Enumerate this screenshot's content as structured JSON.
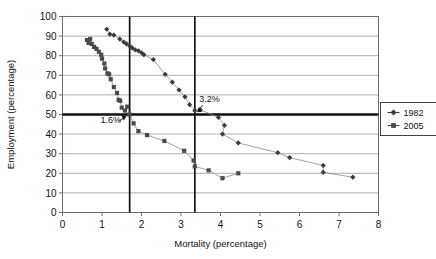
{
  "chart_data": {
    "type": "scatter",
    "title": "",
    "xlabel": "Mortality (percentage)",
    "ylabel": "Employment (percentage)",
    "xlim": [
      0,
      8
    ],
    "ylim": [
      0,
      100
    ],
    "xticks": [
      0,
      1,
      2,
      3,
      4,
      5,
      6,
      7,
      8
    ],
    "yticks": [
      0,
      10,
      20,
      30,
      40,
      50,
      60,
      70,
      80,
      90,
      100
    ],
    "grid": "horizontal",
    "legend_position": "right",
    "series": [
      {
        "name": "1982",
        "marker": "diamond",
        "color": "#3a3a3a",
        "points": [
          [
            1.12,
            93.5
          ],
          [
            1.2,
            91.0
          ],
          [
            1.3,
            90.5
          ],
          [
            1.45,
            88.5
          ],
          [
            1.55,
            87.0
          ],
          [
            1.62,
            86.0
          ],
          [
            1.7,
            85.0
          ],
          [
            1.76,
            84.0
          ],
          [
            1.84,
            83.0
          ],
          [
            1.92,
            82.5
          ],
          [
            2.0,
            81.5
          ],
          [
            2.06,
            80.5
          ],
          [
            2.3,
            78.0
          ],
          [
            2.6,
            70.5
          ],
          [
            2.78,
            66.5
          ],
          [
            2.95,
            62.5
          ],
          [
            3.1,
            59.0
          ],
          [
            3.22,
            55.0
          ],
          [
            3.35,
            52.0
          ],
          [
            3.48,
            52.5
          ],
          [
            3.95,
            48.5
          ],
          [
            4.1,
            44.5
          ],
          [
            4.05,
            40.0
          ],
          [
            4.45,
            35.5
          ],
          [
            5.45,
            30.5
          ],
          [
            5.75,
            28.0
          ],
          [
            6.6,
            24.0
          ],
          [
            6.6,
            20.5
          ],
          [
            7.35,
            18.0
          ]
        ]
      },
      {
        "name": "2005",
        "marker": "square",
        "color": "#4a4a4a",
        "points": [
          [
            0.62,
            88.0
          ],
          [
            0.66,
            86.5
          ],
          [
            0.7,
            88.5
          ],
          [
            0.74,
            86.0
          ],
          [
            0.8,
            84.5
          ],
          [
            0.86,
            83.5
          ],
          [
            0.92,
            82.0
          ],
          [
            0.98,
            80.5
          ],
          [
            1.0,
            78.5
          ],
          [
            1.06,
            76.0
          ],
          [
            1.08,
            73.5
          ],
          [
            1.14,
            71.0
          ],
          [
            1.18,
            70.5
          ],
          [
            1.22,
            68.0
          ],
          [
            1.3,
            64.0
          ],
          [
            1.38,
            61.0
          ],
          [
            1.42,
            57.5
          ],
          [
            1.46,
            57.0
          ],
          [
            1.5,
            53.5
          ],
          [
            1.58,
            52.0
          ],
          [
            1.64,
            54.0
          ],
          [
            1.7,
            50.0
          ],
          [
            1.8,
            45.5
          ],
          [
            1.92,
            41.5
          ],
          [
            2.14,
            39.5
          ],
          [
            2.58,
            36.5
          ],
          [
            3.08,
            31.5
          ],
          [
            3.32,
            26.5
          ],
          [
            3.35,
            23.5
          ],
          [
            3.7,
            21.5
          ],
          [
            4.05,
            17.5
          ],
          [
            4.45,
            20.0
          ]
        ]
      }
    ],
    "reference_lines": [
      {
        "orientation": "vertical",
        "value": 1.7
      },
      {
        "orientation": "vertical",
        "value": 3.35
      },
      {
        "orientation": "horizontal",
        "value": 50.0
      }
    ],
    "annotations": [
      {
        "label": "1.6%",
        "text_x": 1.22,
        "text_y": 45.5,
        "target_x": 1.7,
        "target_y": 50.0
      },
      {
        "label": "3.2%",
        "text_x": 3.72,
        "text_y": 56.5,
        "target_x": 3.35,
        "target_y": 50.0
      }
    ]
  }
}
